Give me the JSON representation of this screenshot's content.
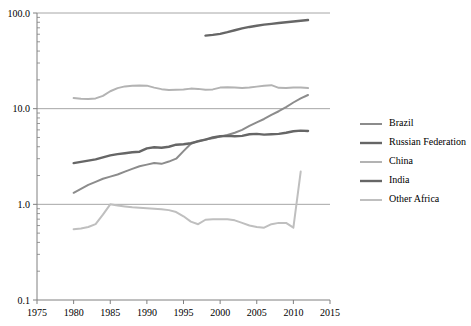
{
  "chart_data": {
    "type": "line",
    "title": "",
    "subtitle": "",
    "xlabel": "",
    "ylabel": "",
    "yscale": "log",
    "xlim": [
      1975,
      2015
    ],
    "ylim": [
      0.1,
      100.0
    ],
    "grid": true,
    "legend_position": "right",
    "x_ticks": [
      "1975",
      "1980",
      "1985",
      "1990",
      "1995",
      "2000",
      "2005",
      "2010",
      "2015"
    ],
    "x_tick_values": [
      1975,
      1980,
      1985,
      1990,
      1995,
      2000,
      2005,
      2010,
      2015
    ],
    "y_ticks": [
      "0.1",
      "1.0",
      "10.0",
      "100.0"
    ],
    "y_tick_values": [
      0.1,
      1.0,
      10.0,
      100.0
    ],
    "series": [
      {
        "name": "Brazil",
        "color": "#8c8c8c",
        "width": 2.0,
        "x": [
          1980,
          1981,
          1982,
          1983,
          1984,
          1985,
          1986,
          1987,
          1988,
          1989,
          1990,
          1991,
          1992,
          1993,
          1994,
          1995,
          1996,
          1997,
          1998,
          1999,
          2000,
          2001,
          2002,
          2003,
          2004,
          2005,
          2006,
          2007,
          2008,
          2009,
          2010,
          2011,
          2012
        ],
        "y": [
          1.32,
          1.45,
          1.6,
          1.72,
          1.85,
          1.95,
          2.05,
          2.2,
          2.35,
          2.5,
          2.6,
          2.7,
          2.65,
          2.8,
          3.0,
          3.6,
          4.3,
          4.6,
          4.75,
          4.9,
          5.1,
          5.3,
          5.6,
          6.0,
          6.6,
          7.2,
          7.8,
          8.6,
          9.4,
          10.4,
          11.6,
          12.8,
          13.9
        ]
      },
      {
        "name": "Russian Federation",
        "color": "#666666",
        "width": 2.4,
        "x": [
          1998,
          1999,
          2000,
          2001,
          2002,
          2003,
          2004,
          2005,
          2006,
          2007,
          2008,
          2009,
          2010,
          2011,
          2012
        ],
        "y": [
          58.0,
          59.0,
          60.5,
          63.0,
          66.0,
          69.0,
          71.5,
          73.5,
          75.5,
          77.0,
          78.5,
          80.0,
          81.5,
          83.0,
          84.5
        ]
      },
      {
        "name": "China",
        "color": "#b3b3b3",
        "width": 2.0,
        "x": [
          1980,
          1981,
          1982,
          1983,
          1984,
          1985,
          1986,
          1987,
          1988,
          1989,
          1990,
          1991,
          1992,
          1993,
          1994,
          1995,
          1996,
          1997,
          1998,
          1999,
          2000,
          2001,
          2002,
          2003,
          2004,
          2005,
          2006,
          2007,
          2008,
          2009,
          2010,
          2011,
          2012
        ],
        "y": [
          12.9,
          12.7,
          12.6,
          12.8,
          13.6,
          15.2,
          16.4,
          17.1,
          17.4,
          17.5,
          17.4,
          16.6,
          16.0,
          15.7,
          15.8,
          15.9,
          16.2,
          16.1,
          15.8,
          15.9,
          16.6,
          16.7,
          16.6,
          16.4,
          16.6,
          17.0,
          17.4,
          17.6,
          16.5,
          16.4,
          16.6,
          16.6,
          16.4
        ]
      },
      {
        "name": "India",
        "color": "#666666",
        "width": 2.4,
        "x": [
          1980,
          1981,
          1982,
          1983,
          1984,
          1985,
          1986,
          1987,
          1988,
          1989,
          1990,
          1991,
          1992,
          1993,
          1994,
          1995,
          1996,
          1997,
          1998,
          1999,
          2000,
          2001,
          2002,
          2003,
          2004,
          2005,
          2006,
          2007,
          2008,
          2009,
          2010,
          2011,
          2012
        ],
        "y": [
          2.7,
          2.78,
          2.86,
          2.95,
          3.1,
          3.25,
          3.35,
          3.42,
          3.5,
          3.55,
          3.85,
          3.95,
          3.9,
          4.0,
          4.2,
          4.25,
          4.35,
          4.55,
          4.75,
          5.0,
          5.15,
          5.2,
          5.15,
          5.2,
          5.4,
          5.45,
          5.35,
          5.4,
          5.45,
          5.6,
          5.8,
          5.9,
          5.85
        ]
      },
      {
        "name": "Other Africa",
        "color": "#bfbfbf",
        "width": 2.0,
        "x": [
          1980,
          1981,
          1982,
          1983,
          1984,
          1985,
          1986,
          1987,
          1988,
          1989,
          1990,
          1991,
          1992,
          1993,
          1994,
          1995,
          1996,
          1997,
          1998,
          1999,
          2000,
          2001,
          2002,
          2003,
          2004,
          2005,
          2006,
          2007,
          2008,
          2009,
          2010,
          2011
        ],
        "y": [
          0.55,
          0.56,
          0.58,
          0.62,
          0.78,
          1.0,
          0.97,
          0.95,
          0.93,
          0.92,
          0.91,
          0.9,
          0.89,
          0.87,
          0.83,
          0.75,
          0.66,
          0.62,
          0.69,
          0.7,
          0.7,
          0.7,
          0.68,
          0.64,
          0.6,
          0.58,
          0.57,
          0.62,
          0.64,
          0.64,
          0.57,
          2.2
        ]
      }
    ]
  },
  "legend": {
    "items": [
      {
        "label": "Brazil"
      },
      {
        "label": "Russian Federation"
      },
      {
        "label": "China"
      },
      {
        "label": "India"
      },
      {
        "label": "Other Africa"
      }
    ]
  }
}
